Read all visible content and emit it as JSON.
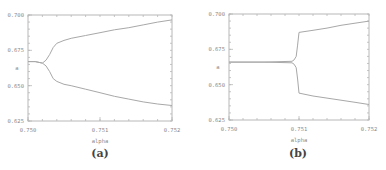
{
  "chart_data": [
    {
      "type": "line",
      "panel": "a",
      "caption": "(a)",
      "title": "",
      "xlabel": "alpha",
      "ylabel": "a",
      "xlim": [
        0.75,
        0.752
      ],
      "ylim": [
        0.625,
        0.7
      ],
      "xticks": [
        "0.750",
        "0.751",
        "0.752"
      ],
      "yticks": [
        "0.625",
        "0.650",
        "0.675",
        "0.700"
      ],
      "x_minor_step": 0.0002,
      "y_minor_step": 0.005,
      "grid": false,
      "frame": {
        "left": 28,
        "top": 15,
        "right": 172,
        "bottom": 121
      },
      "series": [
        {
          "name": "upper branch",
          "x": [
            0.75,
            0.7501,
            0.7502,
            0.75025,
            0.7503,
            0.75035,
            0.7504,
            0.7505,
            0.7506,
            0.7508,
            0.751,
            0.7512,
            0.7514,
            0.7516,
            0.7518,
            0.752
          ],
          "y": [
            0.667,
            0.667,
            0.666,
            0.668,
            0.672,
            0.677,
            0.68,
            0.682,
            0.6835,
            0.6855,
            0.6875,
            0.6895,
            0.691,
            0.693,
            0.695,
            0.6965
          ]
        },
        {
          "name": "lower branch",
          "x": [
            0.75,
            0.7501,
            0.7502,
            0.75025,
            0.7503,
            0.75035,
            0.7504,
            0.7505,
            0.7506,
            0.7508,
            0.751,
            0.7512,
            0.7514,
            0.7516,
            0.7518,
            0.752
          ],
          "y": [
            0.667,
            0.667,
            0.666,
            0.664,
            0.66,
            0.655,
            0.653,
            0.651,
            0.65,
            0.6475,
            0.645,
            0.6425,
            0.6405,
            0.6385,
            0.637,
            0.636
          ]
        }
      ]
    },
    {
      "type": "line",
      "panel": "b",
      "caption": "(b)",
      "title": "",
      "xlabel": "alpha",
      "ylabel": "a",
      "xlim": [
        0.75,
        0.752
      ],
      "ylim": [
        0.625,
        0.7
      ],
      "xticks": [
        "0.750",
        "0.751",
        "0.752"
      ],
      "yticks": [
        "0.625",
        "0.650",
        "0.675",
        "0.700"
      ],
      "x_minor_step": 0.0002,
      "y_minor_step": 0.005,
      "grid": false,
      "frame": {
        "left": 229,
        "top": 14,
        "right": 369,
        "bottom": 120
      },
      "series": [
        {
          "name": "upper branch",
          "x": [
            0.75,
            0.7505,
            0.7509,
            0.75093,
            0.75096,
            0.75098,
            0.751,
            0.7512,
            0.7514,
            0.7516,
            0.7518,
            0.752
          ],
          "y": [
            0.666,
            0.666,
            0.6665,
            0.6675,
            0.67,
            0.678,
            0.687,
            0.6885,
            0.69,
            0.692,
            0.6935,
            0.695
          ]
        },
        {
          "name": "lower branch",
          "x": [
            0.75,
            0.7505,
            0.7509,
            0.75093,
            0.75096,
            0.75098,
            0.751,
            0.7512,
            0.7514,
            0.7516,
            0.7518,
            0.752
          ],
          "y": [
            0.666,
            0.666,
            0.6655,
            0.6645,
            0.662,
            0.654,
            0.644,
            0.642,
            0.6405,
            0.639,
            0.6375,
            0.636
          ]
        }
      ]
    }
  ],
  "colors": {
    "curve": "#a8a8a8",
    "frame": "#b8b8b8",
    "label": "#8a8a8a",
    "caption": "#444444"
  }
}
